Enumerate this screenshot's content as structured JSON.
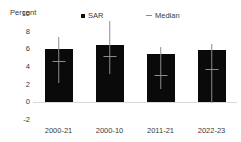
{
  "chart_data": {
    "type": "bar",
    "title": "",
    "xlabel": "",
    "ylabel": "Percent",
    "ylim": [
      -2,
      10
    ],
    "yticks": [
      10,
      8,
      6,
      4,
      2,
      0,
      -2
    ],
    "grid": false,
    "legend_position": "top",
    "categories": [
      "2000-21",
      "2000-10",
      "2011-21",
      "2022-23"
    ],
    "series": [
      {
        "name": "SAR",
        "type": "bar",
        "color": "#0a0a0a",
        "marker": "square",
        "values": [
          6.0,
          6.5,
          5.5,
          5.9
        ]
      },
      {
        "name": "Median",
        "type": "errorbar-median",
        "color": "#8c8c8c",
        "marker": "dash",
        "values": [
          4.7,
          5.3,
          3.1,
          3.8
        ],
        "whisker_low": [
          2.2,
          3.2,
          1.5,
          -0.1
        ],
        "whisker_high": [
          7.4,
          9.2,
          6.3,
          6.6
        ]
      }
    ]
  },
  "legend": {
    "items": [
      {
        "label": "SAR",
        "marker": "square-marker"
      },
      {
        "label": "Median",
        "marker": "dash-marker"
      }
    ]
  },
  "axis": {
    "y_title": "Percent"
  }
}
